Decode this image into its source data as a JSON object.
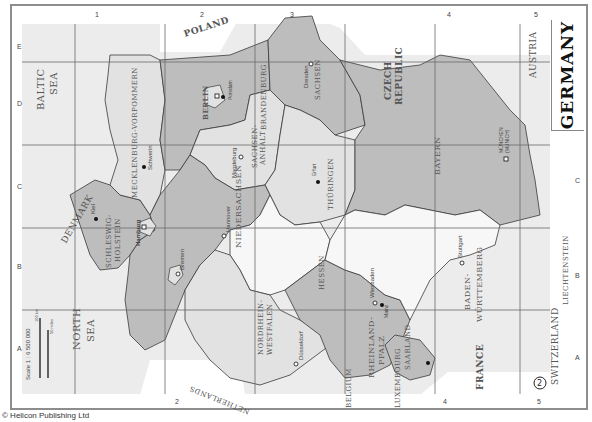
{
  "map": {
    "title": "Germany",
    "title_display": "GERMANY",
    "page_badge": "2",
    "credit": "© Helicon Publishing Ltd",
    "scale": {
      "label": "Scale 1 : 6 500 000",
      "km_label": "100 km",
      "miles_label": "50 miles",
      "zero": "0"
    },
    "grid": {
      "columns": [
        "1",
        "2",
        "3",
        "4",
        "5"
      ],
      "rows": [
        "A",
        "B",
        "C",
        "D",
        "E"
      ],
      "degree_marks": [
        "6°",
        "8°",
        "10°",
        "12°",
        "14°",
        "48°",
        "50°",
        "52°",
        "54°"
      ]
    },
    "seas": [
      {
        "name": "BALTIC SEA",
        "line1": "BALTIC",
        "line2": "SEA"
      },
      {
        "name": "NORTH SEA",
        "line1": "NORTH",
        "line2": "SEA"
      }
    ],
    "countries": [
      {
        "name": "POLAND"
      },
      {
        "name": "CZECH REPUBLIC",
        "line1": "CZECH",
        "line2": "REPUBLIC"
      },
      {
        "name": "AUSTRIA"
      },
      {
        "name": "LIECHTENSTEIN"
      },
      {
        "name": "SWITZERLAND"
      },
      {
        "name": "FRANCE"
      },
      {
        "name": "LUXEMBOURG"
      },
      {
        "name": "BELGIUM"
      },
      {
        "name": "NETHERLANDS"
      },
      {
        "name": "DENMARK"
      }
    ],
    "states": [
      {
        "name": "SCHLESWIG-HOLSTEIN",
        "line1": "SCHLESWIG-",
        "line2": "HOLSTEIN",
        "shade": "dark"
      },
      {
        "name": "MECKLENBURG-VORPOMMERN",
        "shade": "light"
      },
      {
        "name": "BRANDENBURG",
        "shade": "dark"
      },
      {
        "name": "BERLIN",
        "shade": "light"
      },
      {
        "name": "HAMBURG",
        "shade": "light"
      },
      {
        "name": "BREMEN",
        "shade": "light"
      },
      {
        "name": "NIEDERSACHSEN",
        "shade": "dark"
      },
      {
        "name": "SACHSEN-ANHALT",
        "line1": "SACHSEN-",
        "line2": "ANHALT",
        "shade": "light"
      },
      {
        "name": "SACHSEN",
        "shade": "dark"
      },
      {
        "name": "THÜRINGEN",
        "shade": "light"
      },
      {
        "name": "NORDRHEIN-WESTFALEN",
        "line1": "NORDRHEIN-",
        "line2": "WESTFALEN",
        "shade": "light"
      },
      {
        "name": "HESSEN",
        "shade": "white"
      },
      {
        "name": "RHEINLAND-PFALZ",
        "line1": "RHEINLAND-",
        "line2": "PFALZ",
        "shade": "dark"
      },
      {
        "name": "SAARLAND",
        "shade": "dark"
      },
      {
        "name": "BADEN-WÜRTTEMBERG",
        "line1": "BADEN-",
        "line2": "WÜRTTEMBERG",
        "shade": "white"
      },
      {
        "name": "BAYERN",
        "shade": "dark"
      }
    ],
    "cities": [
      {
        "name": "Schwerin",
        "symbol": "dot"
      },
      {
        "name": "Kiel",
        "symbol": "dot"
      },
      {
        "name": "Hamburg",
        "symbol": "square"
      },
      {
        "name": "Bremen",
        "symbol": "circle"
      },
      {
        "name": "Hannover",
        "symbol": "circle"
      },
      {
        "name": "Magdeburg",
        "symbol": "circle"
      },
      {
        "name": "Berlin",
        "symbol": "square"
      },
      {
        "name": "Potsdam",
        "symbol": "dot"
      },
      {
        "name": "Dresden",
        "symbol": "circle"
      },
      {
        "name": "Erfurt",
        "symbol": "dot"
      },
      {
        "name": "Düsseldorf",
        "symbol": "circle"
      },
      {
        "name": "Wiesbaden",
        "symbol": "circle"
      },
      {
        "name": "Mainz",
        "symbol": "dot"
      },
      {
        "name": "Saarbrücken",
        "symbol": "dot"
      },
      {
        "name": "Stuttgart",
        "symbol": "circle"
      },
      {
        "name": "München (Munich)",
        "line1": "MÜNCHEN",
        "line2": "(MUNICH)",
        "symbol": "square"
      }
    ],
    "colors": {
      "dark_fill": "#bdbdbd",
      "light_fill": "#e2e2e2",
      "white_fill": "#f7f7f7",
      "sea_fill": "#ececec",
      "border": "#3a3a3a",
      "grid_line": "#6a6a6a",
      "text": "#555555"
    }
  }
}
